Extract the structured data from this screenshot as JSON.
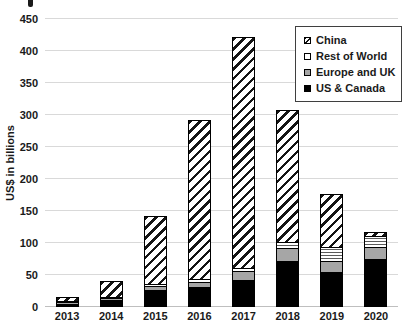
{
  "chart": {
    "ylabel": "US$ in billions"
  },
  "chart_data": {
    "type": "bar",
    "stacked": true,
    "title": "",
    "xlabel": "",
    "ylabel": "US$ in billions",
    "categories": [
      "2013",
      "2014",
      "2015",
      "2016",
      "2017",
      "2018",
      "2019",
      "2020"
    ],
    "series": [
      {
        "name": "US & Canada",
        "color": "#000000",
        "pattern": "solid",
        "values": [
          3,
          9,
          25,
          29,
          40,
          70,
          53,
          73
        ]
      },
      {
        "name": "Europe and UK",
        "color": "#a6a6a6",
        "pattern": "solid",
        "values": [
          1,
          2,
          7,
          9,
          15,
          20,
          18,
          19
        ]
      },
      {
        "name": "Rest of World",
        "color": "#ffffff",
        "pattern": "horizontal-lines",
        "values": [
          1,
          1,
          3,
          4,
          5,
          10,
          21,
          18
        ]
      },
      {
        "name": "China",
        "color": "#ffffff",
        "pattern": "diagonal-hatch",
        "values": [
          5,
          25,
          105,
          248,
          360,
          206,
          83,
          5
        ]
      }
    ],
    "totals": [
      10,
      37,
      140,
      290,
      420,
      306,
      175,
      115
    ],
    "ylim": [
      0,
      450
    ],
    "yticks": [
      0,
      50,
      100,
      150,
      200,
      250,
      300,
      350,
      400,
      450
    ],
    "grid": true,
    "legend": {
      "position": "top-right",
      "entries": [
        "China",
        "Rest of World",
        "Europe and UK",
        "US & Canada"
      ]
    },
    "colors": {
      "bar_outline": "#000000",
      "gridline": "#d9d9d9",
      "text": "#1a1a1a",
      "hatch_stroke": "#141414",
      "gray_fill": "#a6a6a6"
    }
  }
}
